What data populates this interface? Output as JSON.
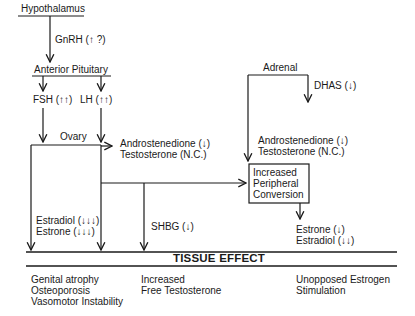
{
  "nodes": {
    "hypothalamus": "Hypothalamus",
    "gnrh": "GnRH (↑ ?)",
    "anterior_pituitary": "Anterior Pituitary",
    "fsh": "FSH (↑↑)",
    "lh": "LH (↑↑)",
    "ovary": "Ovary",
    "ovary_androgens": [
      "Androstenedione (↓)",
      "Testosterone (N.C.)"
    ],
    "adrenal": "Adrenal",
    "dhas": "DHAS (↓)",
    "adrenal_androgens": [
      "Androstenedione (↓)",
      "Testosterone (N.C.)"
    ],
    "conversion_box": [
      "Increased",
      "Peripheral",
      "Conversion"
    ],
    "ovary_estrogens": [
      "Estradiol (↓↓↓)",
      "Estrone (↓↓↓)"
    ],
    "shbg": "SHBG (↓)",
    "peripheral_estrogens": [
      "Estrone (↓)",
      "Estradiol (↓↓)"
    ]
  },
  "tissue_effect": {
    "title": "TISSUE EFFECT",
    "columns": [
      [
        "Genital atrophy",
        "Osteoporosis",
        "Vasomotor Instability"
      ],
      [
        "Increased",
        "Free Testosterone"
      ],
      [
        "Unopposed Estrogen",
        "Stimulation"
      ]
    ]
  },
  "colors": {
    "ink": "#1a1a1a",
    "background": "#ffffff"
  }
}
